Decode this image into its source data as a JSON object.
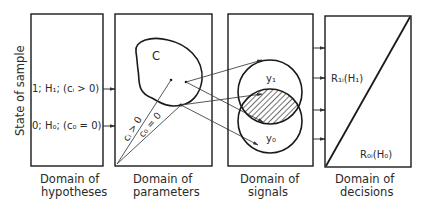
{
  "diagram": {
    "y_axis_label": "State of sample",
    "panels": [
      {
        "id": "hypotheses",
        "caption_line1": "Domain of",
        "caption_line2": "hypotheses",
        "items": [
          {
            "label": "1; H₁; (cᵢ > 0)"
          },
          {
            "label": "0; H₀; (c₀ = 0)"
          }
        ]
      },
      {
        "id": "parameters",
        "caption_line1": "Domain of",
        "caption_line2": "parameters",
        "region_label": "C",
        "ray_labels": [
          "cᵢ > 0",
          "c₀ = 0"
        ]
      },
      {
        "id": "signals",
        "caption_line1": "Domain of",
        "caption_line2": "signals",
        "circles": [
          {
            "label": "y₁"
          },
          {
            "label": "y₀"
          }
        ],
        "overlap": "hatched"
      },
      {
        "id": "decisions",
        "caption_line1": "Domain of",
        "caption_line2": "decisions",
        "regions": [
          {
            "label": "R₁ᵢ(H₁)"
          },
          {
            "label": "R₀ᵢ(H₀)"
          }
        ]
      }
    ],
    "colors": {
      "line": "#1a1a1a",
      "thin_line": "#444444",
      "background": "#ffffff"
    }
  }
}
